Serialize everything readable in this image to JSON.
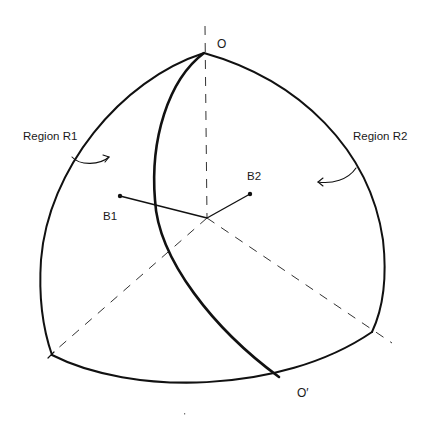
{
  "diagram": {
    "title": "",
    "colors": {
      "stroke": "#111111",
      "dash": "#333333",
      "background": "#ffffff"
    },
    "labels": {
      "apex_top": "O",
      "apex_bottom": "O′",
      "region1": "Region R1",
      "region2": "Region R2",
      "point1": "B1",
      "point2": "B2"
    },
    "points": {
      "O": [
        204,
        53
      ],
      "O_prime": [
        279,
        377
      ],
      "center": [
        207,
        218
      ],
      "B1": [
        120,
        196
      ],
      "B2": [
        250,
        194
      ],
      "corner_left": [
        52,
        355
      ],
      "corner_right": [
        372,
        332
      ]
    },
    "elements": [
      "spherical triangle outline (solid)",
      "meridian dividing arc O to O′ (solid, thick)",
      "vertical dashed axis through O",
      "dashed axes from center to bottom-left and bottom-right corners",
      "segments from center to B1 and B2",
      "curved arrows indicating Region R1 and Region R2"
    ]
  }
}
